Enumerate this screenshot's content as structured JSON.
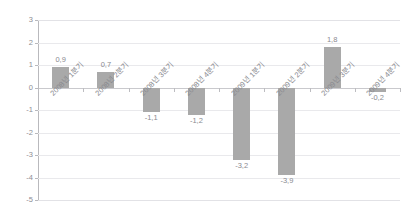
{
  "chart_data": {
    "type": "bar",
    "title": "",
    "subtitle": "",
    "xlabel": "",
    "ylabel": "",
    "ylim": [
      -5,
      3
    ],
    "ytick_step": 1,
    "ytick_labels": [
      "3",
      "2",
      "1",
      "0",
      "-1",
      "-2",
      "-3",
      "-4",
      "-5"
    ],
    "ytick_values": [
      3,
      2,
      1,
      0,
      -1,
      -2,
      -3,
      -4,
      -5
    ],
    "grid": true,
    "legend": "none",
    "decimal_separator": ",",
    "categories": [
      "2008년 1분기",
      "2008년 2분기",
      "2008년 3분기",
      "2008년 4분기",
      "2009년 1분기",
      "2009년 2분기",
      "2009년 3분기",
      "2009년 4분기"
    ],
    "values": [
      0.9,
      0.7,
      -1.1,
      -1.2,
      -3.2,
      -3.9,
      1.8,
      -0.2
    ],
    "value_labels": [
      "0,9",
      "0,7",
      "-1,1",
      "-1,2",
      "-3,2",
      "-3,9",
      "1,8",
      "-0,2"
    ],
    "series": [
      {
        "name": "",
        "values": [
          0.9,
          0.7,
          -1.1,
          -1.2,
          -3.2,
          -3.9,
          1.8,
          -0.2
        ]
      }
    ],
    "colors": {
      "bar": "#a9a9a9",
      "text": "#8a8a90",
      "grid": "#e9e9ec",
      "axis": "#b9b9bd",
      "zero_line": "#c9c9cd",
      "background": "#ffffff"
    }
  }
}
